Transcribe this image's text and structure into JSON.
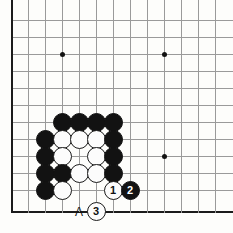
{
  "figure": {
    "kind": "go-board-diagram",
    "title": "",
    "board": {
      "origin_x": 11,
      "origin_y": 20,
      "cell": 17,
      "cols": 13,
      "rows": 12,
      "line_color": "#9a9a9a",
      "edge_color": "#1b1b1b",
      "background": "#fdfdfb"
    },
    "star_points": [
      {
        "col": 3,
        "row": 2
      },
      {
        "col": 9,
        "row": 2
      },
      {
        "col": 9,
        "row": 8
      }
    ],
    "stones": [
      {
        "col": 3,
        "row": 6,
        "color": "black",
        "label": ""
      },
      {
        "col": 4,
        "row": 6,
        "color": "black",
        "label": ""
      },
      {
        "col": 5,
        "row": 6,
        "color": "black",
        "label": ""
      },
      {
        "col": 6,
        "row": 6,
        "color": "black",
        "label": ""
      },
      {
        "col": 2,
        "row": 7,
        "color": "black",
        "label": ""
      },
      {
        "col": 3,
        "row": 7,
        "color": "white",
        "label": ""
      },
      {
        "col": 4,
        "row": 7,
        "color": "white",
        "label": ""
      },
      {
        "col": 5,
        "row": 7,
        "color": "white",
        "label": ""
      },
      {
        "col": 6,
        "row": 7,
        "color": "black",
        "label": ""
      },
      {
        "col": 2,
        "row": 8,
        "color": "black",
        "label": ""
      },
      {
        "col": 3,
        "row": 8,
        "color": "white",
        "label": ""
      },
      {
        "col": 5,
        "row": 8,
        "color": "white",
        "label": ""
      },
      {
        "col": 6,
        "row": 8,
        "color": "black",
        "label": ""
      },
      {
        "col": 2,
        "row": 9,
        "color": "black",
        "label": ""
      },
      {
        "col": 3,
        "row": 9,
        "color": "black",
        "label": ""
      },
      {
        "col": 4,
        "row": 9,
        "color": "white",
        "label": ""
      },
      {
        "col": 5,
        "row": 9,
        "color": "white",
        "label": ""
      },
      {
        "col": 6,
        "row": 9,
        "color": "black",
        "label": ""
      },
      {
        "col": 2,
        "row": 10,
        "color": "black",
        "label": ""
      },
      {
        "col": 3,
        "row": 10,
        "color": "white",
        "label": ""
      },
      {
        "col": 6,
        "row": 10,
        "color": "white",
        "label": "1"
      },
      {
        "col": 7,
        "row": 10,
        "color": "black",
        "label": "2"
      },
      {
        "col": 5,
        "row": 11.28,
        "color": "white",
        "label": "3"
      }
    ],
    "point_labels": [
      {
        "col": 4,
        "row": 11.28,
        "text": "A"
      }
    ],
    "move_numbers": {
      "move_1": "1",
      "move_2": "2",
      "move_3": "3"
    },
    "colors": {
      "black_stone": "#121212",
      "white_stone": "#fcfcfc",
      "stone_outline": "#1a1a1a",
      "grid": "#9a9a9a",
      "edge": "#1b1b1b"
    }
  }
}
